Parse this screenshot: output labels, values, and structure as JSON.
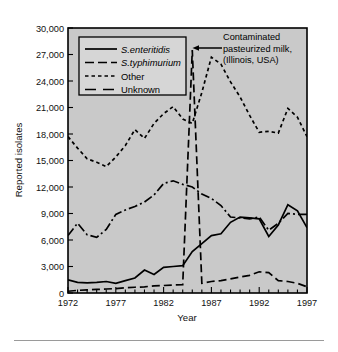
{
  "figure": {
    "background_color": "#ffffff",
    "plot_background_color": "#c9c9c9",
    "line_color": "#000000"
  },
  "chart_data": {
    "type": "line",
    "title": "",
    "xlabel": "Year",
    "ylabel": "Reported isolates",
    "xlim": [
      1972,
      1997
    ],
    "ylim": [
      0,
      30000
    ],
    "grid": false,
    "legend_position": "top-left-inside",
    "x_tick_labels": [
      "1972",
      "1977",
      "1982",
      "1987",
      "1992",
      "1997"
    ],
    "x_tick_values": [
      1972,
      1977,
      1982,
      1987,
      1992,
      1997
    ],
    "x_minor_tick_interval": 1,
    "y_tick_labels": [
      "0",
      "3,000",
      "6,000",
      "9,000",
      "12,000",
      "15,000",
      "18,000",
      "21,000",
      "24,000",
      "27,000",
      "30,000"
    ],
    "y_tick_values": [
      0,
      3000,
      6000,
      9000,
      12000,
      15000,
      18000,
      21000,
      24000,
      27000,
      30000
    ],
    "x": [
      1972,
      1973,
      1974,
      1975,
      1976,
      1977,
      1978,
      1979,
      1980,
      1981,
      1982,
      1983,
      1984,
      1985,
      1986,
      1987,
      1988,
      1989,
      1990,
      1991,
      1992,
      1993,
      1994,
      1995,
      1996,
      1997
    ],
    "series": [
      {
        "name": "S. enteritidis",
        "label": "S.enteritidis",
        "italic": true,
        "dash": "solid",
        "dasharray": "none",
        "values": [
          1500,
          1200,
          1150,
          1200,
          1300,
          1100,
          1400,
          1700,
          2600,
          2100,
          2900,
          3000,
          3100,
          4700,
          5600,
          6500,
          6700,
          8000,
          8600,
          8500,
          8400,
          6400,
          7700,
          10000,
          9300,
          7400
        ]
      },
      {
        "name": "S. typhimurium",
        "label": "S.typhimurium",
        "italic": true,
        "dash": "dash-dot",
        "dasharray": "9,3,2,3",
        "values": [
          6500,
          7900,
          6600,
          6300,
          7200,
          8900,
          9400,
          9800,
          10300,
          11100,
          12400,
          12700,
          12300,
          12000,
          11200,
          10700,
          9900,
          8600,
          8500,
          8400,
          8600,
          7100,
          7900,
          9000,
          8900,
          8900
        ]
      },
      {
        "name": "Other",
        "label": "Other",
        "italic": false,
        "dash": "dotted",
        "dasharray": "3.5,3",
        "values": [
          17700,
          16400,
          15200,
          14800,
          14300,
          15400,
          16700,
          18500,
          17500,
          19200,
          20300,
          21100,
          19700,
          19200,
          22700,
          26700,
          25900,
          23900,
          22200,
          20100,
          18200,
          18300,
          18100,
          20900,
          19900,
          17700
        ]
      },
      {
        "name": "Unknown",
        "label": "Unknown",
        "italic": false,
        "dash": "long-dash",
        "dasharray": "8,4",
        "values": [
          200,
          300,
          350,
          400,
          450,
          500,
          600,
          650,
          700,
          800,
          850,
          900,
          950,
          27500,
          1100,
          1300,
          1400,
          1600,
          1800,
          2000,
          2400,
          2300,
          1400,
          1300,
          1100,
          700
        ]
      }
    ],
    "annotations": [
      {
        "name": "contaminated-milk-annotation",
        "lines": [
          "Contaminated",
          "pasteurized milk,",
          "(Illinois, USA)"
        ],
        "arrow": "left",
        "points_to_year": 1985,
        "points_to_value": 27500
      }
    ]
  },
  "legend": {
    "entries": [
      {
        "label": "S.enteritidis",
        "style": "solid"
      },
      {
        "label": "S.typhimurium",
        "style": "dash-dot"
      },
      {
        "label": "Other",
        "style": "dotted"
      },
      {
        "label": "Unknown",
        "style": "long-dash"
      }
    ]
  },
  "annotation": {
    "line1": "Contaminated",
    "line2": "pasteurized milk,",
    "line3": "(Illinois, USA)"
  },
  "axes": {
    "y_title": "Reported isolates",
    "x_title": "Year"
  }
}
